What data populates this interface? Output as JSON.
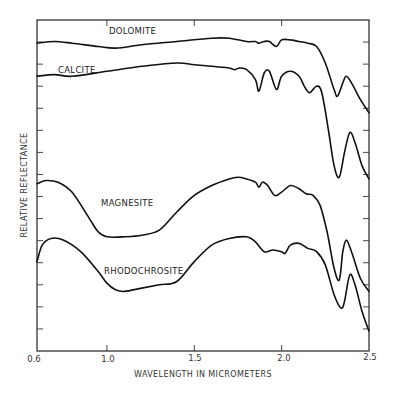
{
  "chart_data": {
    "type": "line",
    "title": "",
    "xlabel": "WAVELENGTH IN MICROMETERS",
    "ylabel": "RELATIVE REFLECTANCE",
    "xlim": [
      0.6,
      2.5
    ],
    "xticks": [
      "0.6",
      "1.0",
      "1.5",
      "2.0",
      "2.5"
    ],
    "yticks_labeled": false,
    "grid": false,
    "legend": "inline curve labels",
    "series": [
      {
        "name": "DOLOMITE",
        "label_pos": [
          0.95,
          0.955
        ],
        "points": [
          [
            0.6,
            0.93
          ],
          [
            0.7,
            0.935
          ],
          [
            0.8,
            0.93
          ],
          [
            0.95,
            0.92
          ],
          [
            1.05,
            0.915
          ],
          [
            1.2,
            0.925
          ],
          [
            1.4,
            0.935
          ],
          [
            1.6,
            0.945
          ],
          [
            1.7,
            0.945
          ],
          [
            1.8,
            0.935
          ],
          [
            1.85,
            0.935
          ],
          [
            1.87,
            0.93
          ],
          [
            1.9,
            0.935
          ],
          [
            1.93,
            0.935
          ],
          [
            1.97,
            0.92
          ],
          [
            2.0,
            0.94
          ],
          [
            2.05,
            0.94
          ],
          [
            2.1,
            0.935
          ],
          [
            2.15,
            0.93
          ],
          [
            2.2,
            0.92
          ],
          [
            2.25,
            0.87
          ],
          [
            2.3,
            0.79
          ],
          [
            2.32,
            0.77
          ],
          [
            2.35,
            0.81
          ],
          [
            2.37,
            0.83
          ],
          [
            2.4,
            0.81
          ],
          [
            2.45,
            0.76
          ],
          [
            2.5,
            0.72
          ]
        ]
      },
      {
        "name": "CALCITE",
        "label_pos": [
          0.75,
          0.87
        ],
        "points": [
          [
            0.6,
            0.83
          ],
          [
            0.7,
            0.835
          ],
          [
            0.8,
            0.83
          ],
          [
            1.0,
            0.845
          ],
          [
            1.2,
            0.86
          ],
          [
            1.4,
            0.87
          ],
          [
            1.5,
            0.865
          ],
          [
            1.6,
            0.86
          ],
          [
            1.7,
            0.855
          ],
          [
            1.73,
            0.85
          ],
          [
            1.76,
            0.855
          ],
          [
            1.8,
            0.85
          ],
          [
            1.85,
            0.82
          ],
          [
            1.87,
            0.785
          ],
          [
            1.9,
            0.84
          ],
          [
            1.93,
            0.845
          ],
          [
            1.97,
            0.79
          ],
          [
            2.0,
            0.83
          ],
          [
            2.05,
            0.845
          ],
          [
            2.1,
            0.83
          ],
          [
            2.13,
            0.8
          ],
          [
            2.16,
            0.78
          ],
          [
            2.2,
            0.8
          ],
          [
            2.23,
            0.78
          ],
          [
            2.27,
            0.66
          ],
          [
            2.3,
            0.56
          ],
          [
            2.33,
            0.525
          ],
          [
            2.36,
            0.6
          ],
          [
            2.39,
            0.66
          ],
          [
            2.42,
            0.63
          ],
          [
            2.46,
            0.56
          ],
          [
            2.5,
            0.52
          ]
        ]
      },
      {
        "name": "MAGNESITE",
        "label_pos": [
          1.05,
          0.42
        ],
        "points": [
          [
            0.6,
            0.505
          ],
          [
            0.65,
            0.515
          ],
          [
            0.72,
            0.51
          ],
          [
            0.8,
            0.48
          ],
          [
            0.9,
            0.4
          ],
          [
            0.95,
            0.36
          ],
          [
            1.0,
            0.345
          ],
          [
            1.1,
            0.345
          ],
          [
            1.2,
            0.35
          ],
          [
            1.3,
            0.365
          ],
          [
            1.4,
            0.42
          ],
          [
            1.5,
            0.47
          ],
          [
            1.6,
            0.5
          ],
          [
            1.7,
            0.52
          ],
          [
            1.75,
            0.525
          ],
          [
            1.8,
            0.52
          ],
          [
            1.85,
            0.51
          ],
          [
            1.87,
            0.495
          ],
          [
            1.89,
            0.51
          ],
          [
            1.92,
            0.5
          ],
          [
            1.96,
            0.47
          ],
          [
            2.0,
            0.48
          ],
          [
            2.05,
            0.5
          ],
          [
            2.1,
            0.49
          ],
          [
            2.14,
            0.475
          ],
          [
            2.18,
            0.47
          ],
          [
            2.22,
            0.44
          ],
          [
            2.26,
            0.36
          ],
          [
            2.3,
            0.25
          ],
          [
            2.33,
            0.215
          ],
          [
            2.35,
            0.3
          ],
          [
            2.37,
            0.335
          ],
          [
            2.4,
            0.3
          ],
          [
            2.45,
            0.22
          ],
          [
            2.5,
            0.18
          ]
        ]
      },
      {
        "name": "RHODOCHROSITE",
        "label_pos": [
          1.05,
          0.3
        ],
        "points": [
          [
            0.6,
            0.27
          ],
          [
            0.63,
            0.32
          ],
          [
            0.68,
            0.34
          ],
          [
            0.75,
            0.335
          ],
          [
            0.85,
            0.3
          ],
          [
            0.95,
            0.24
          ],
          [
            1.0,
            0.205
          ],
          [
            1.05,
            0.185
          ],
          [
            1.1,
            0.18
          ],
          [
            1.2,
            0.19
          ],
          [
            1.3,
            0.2
          ],
          [
            1.4,
            0.21
          ],
          [
            1.5,
            0.27
          ],
          [
            1.6,
            0.32
          ],
          [
            1.7,
            0.34
          ],
          [
            1.8,
            0.345
          ],
          [
            1.85,
            0.33
          ],
          [
            1.9,
            0.3
          ],
          [
            1.95,
            0.305
          ],
          [
            2.0,
            0.3
          ],
          [
            2.02,
            0.295
          ],
          [
            2.05,
            0.32
          ],
          [
            2.1,
            0.325
          ],
          [
            2.15,
            0.31
          ],
          [
            2.2,
            0.3
          ],
          [
            2.25,
            0.26
          ],
          [
            2.3,
            0.17
          ],
          [
            2.34,
            0.13
          ],
          [
            2.36,
            0.15
          ],
          [
            2.39,
            0.23
          ],
          [
            2.42,
            0.2
          ],
          [
            2.46,
            0.12
          ],
          [
            2.5,
            0.06
          ]
        ]
      }
    ]
  },
  "labels": {
    "dolomite": "DOLOMITE",
    "calcite": "CALCITE",
    "magnesite": "MAGNESITE",
    "rhodochrosite": "RHODOCHROSITE",
    "xlabel": "WAVELENGTH IN MICROMETERS",
    "ylabel": "RELATIVE REFLECTANCE",
    "x_ticks": [
      "0.6",
      "1.0",
      "1.5",
      "2.0",
      "2.5"
    ]
  }
}
